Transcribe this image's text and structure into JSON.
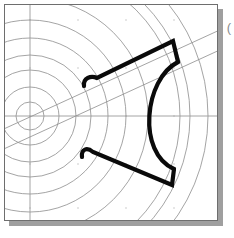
{
  "app": {
    "title": "CAD Drawing Viewport",
    "background_color": "#ffffff"
  },
  "viewport": {
    "name": "drawing-canvas",
    "width": 214,
    "height": 217,
    "background_color": "#ffffff",
    "border_color": "#6e6e6e",
    "shadow_color": "#9f9f9f"
  },
  "marginal_glyph": {
    "label": "(",
    "color": "#8a8a8a"
  },
  "style": {
    "construction_color": "#8d8d8d",
    "construction_width": 0.8,
    "axis_color": "#9a9a9a",
    "axis_width": 0.9,
    "profile_color": "#0a0a0a",
    "profile_width": 4.2,
    "dot_color": "#b9b9b9"
  },
  "geometry": {
    "polar_center": {
      "x": 25,
      "y": 111
    },
    "concentric_radii": [
      14,
      29,
      46,
      61,
      78,
      96,
      118,
      150
    ],
    "outer_arc_radii": [
      160,
      178
    ],
    "axes": {
      "vertical_x": 25,
      "horizontal_y": 111
    },
    "diagonal_band": {
      "angle_deg": -24,
      "offset": 11,
      "p1": {
        "x": -8,
        "y": 128
      },
      "p2": {
        "x": 228,
        "y": 22
      },
      "q1": {
        "x": -8,
        "y": 148
      },
      "q2": {
        "x": 228,
        "y": 42
      }
    },
    "dot_grid": {
      "origin_x": 25,
      "origin_y": 15,
      "step_x": 48,
      "step_y": 48
    },
    "profile_upper": {
      "hook_start": {
        "x": 83,
        "y": 79
      },
      "hook_ctrl": {
        "x": 83,
        "y": 72
      },
      "hook_end": {
        "x": 93,
        "y": 73
      },
      "ridge_end": {
        "x": 168,
        "y": 37
      },
      "shoulder_end": {
        "x": 173,
        "y": 56
      }
    },
    "profile_arc": {
      "start": {
        "x": 173,
        "y": 56
      },
      "bulge": {
        "x": 135,
        "y": 111
      },
      "end": {
        "x": 170,
        "y": 164
      }
    },
    "profile_lower": {
      "corner": {
        "x": 167,
        "y": 180
      },
      "ramp_end": {
        "x": 88,
        "y": 148
      },
      "hook_ctrl": {
        "x": 80,
        "y": 143
      },
      "hook_end": {
        "x": 79,
        "y": 151
      }
    }
  }
}
